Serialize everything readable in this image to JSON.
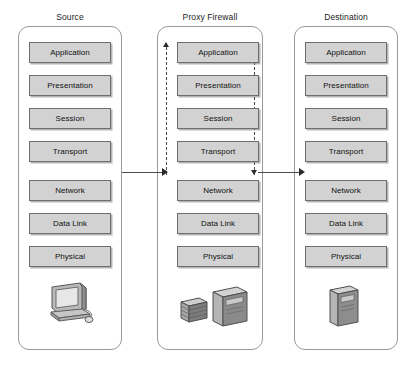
{
  "diagram": {
    "layer_names": [
      "Application",
      "Presentation",
      "Session",
      "Transport",
      "Network",
      "Data Link",
      "Physical"
    ],
    "colors": {
      "layer_fill": "#d2d2d2",
      "layer_border": "#6e6e6e",
      "container_border": "#9a9a9a",
      "arrow": "#2b2b2b",
      "dashed_path": "#4a4a4a",
      "background": "#ffffff",
      "text": "#111111"
    },
    "columns": [
      {
        "id": "source",
        "title": "Source",
        "layers": [
          "Application",
          "Presentation",
          "Session",
          "Transport",
          "Network",
          "Data Link",
          "Physical"
        ],
        "device_icon": "desktop-computer-icon"
      },
      {
        "id": "proxy-firewall",
        "title": "Proxy Firewall",
        "layers": [
          "Application",
          "Presentation",
          "Session",
          "Transport",
          "Network",
          "Data Link",
          "Physical"
        ],
        "device_icon": "firewall-server-icon",
        "internal_path": {
          "left_arrow_direction": "up",
          "right_arrow_direction": "down",
          "style": "dashed"
        }
      },
      {
        "id": "destination",
        "title": "Destination",
        "layers": [
          "Application",
          "Presentation",
          "Session",
          "Transport",
          "Network",
          "Data Link",
          "Physical"
        ],
        "device_icon": "server-tower-icon"
      }
    ],
    "connectors": [
      {
        "id": "source-to-firewall",
        "from": "source",
        "to": "proxy-firewall",
        "direction": "right",
        "style": "solid"
      },
      {
        "id": "firewall-to-destination",
        "from": "proxy-firewall",
        "to": "destination",
        "direction": "right",
        "style": "solid"
      }
    ]
  }
}
